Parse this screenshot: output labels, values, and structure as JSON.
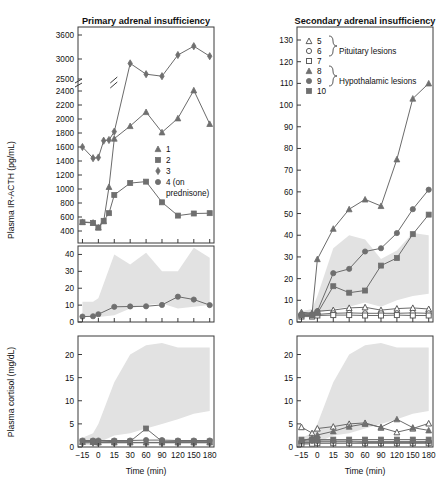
{
  "figure": {
    "panels": [
      {
        "id": "primary",
        "title": "Primary adrenal insufficiency"
      },
      {
        "id": "secondary",
        "title": "Secondary adrenal insufficiency"
      }
    ],
    "axis_labels": {
      "y_acth": "Plasma IR-ACTH (pg/mL)",
      "y_cortisol": "Plasma cortisol (mg/dL)",
      "x_time": "Time (min)"
    }
  },
  "legends": {
    "primary": {
      "items": [
        {
          "marker": "triangle-filled",
          "label": "1"
        },
        {
          "marker": "square-filled",
          "label": "2"
        },
        {
          "marker": "diamond-filled",
          "label": "3"
        },
        {
          "marker": "circle-filled",
          "label": "4 (on"
        },
        {
          "marker": "none",
          "label": "prednisone)"
        }
      ]
    },
    "secondary": {
      "items": [
        {
          "marker": "triangle-open",
          "label": "5"
        },
        {
          "marker": "circle-open",
          "label": "6"
        },
        {
          "marker": "square-open",
          "label": "7"
        },
        {
          "marker": "triangle-filled",
          "label": "8"
        },
        {
          "marker": "circle-filled",
          "label": "9"
        },
        {
          "marker": "square-filled",
          "label": "10"
        }
      ],
      "group_labels": [
        "Pituitary lesions",
        "Hypothalamic lesions"
      ]
    }
  },
  "chart_data": [
    {
      "id": "primary-acth-upper",
      "type": "line",
      "title": "Primary adrenal insufficiency",
      "xlabel": "Time (min)",
      "ylabel": "Plasma IR-ACTH (pg/mL)",
      "x": [
        -15,
        -10,
        -5,
        0,
        5,
        10,
        15,
        30,
        60,
        90,
        120,
        150,
        180
      ],
      "xlim": [
        -20,
        188
      ],
      "ylim": [
        350,
        3750
      ],
      "yticks": [
        400,
        600,
        800,
        1000,
        1200,
        1400,
        1600,
        1800,
        2000,
        2200,
        2400,
        2500,
        3000,
        3600
      ],
      "axis_break_between": [
        2400,
        2500
      ],
      "xticks": [
        -15,
        0,
        15,
        30,
        60,
        90,
        120,
        150,
        180
      ],
      "xticklabels": [
        "-15",
        "0",
        "15",
        "30",
        "60",
        "90",
        "120",
        "150",
        "180"
      ],
      "grid": false,
      "series": [
        {
          "name": "1",
          "marker": "triangle-filled",
          "x": [
            -15,
            -5,
            0,
            5,
            10,
            15,
            30,
            60,
            90,
            120,
            150,
            180
          ],
          "values": [
            530,
            520,
            450,
            540,
            1030,
            1720,
            1900,
            2100,
            1810,
            2010,
            2410,
            1930
          ]
        },
        {
          "name": "2",
          "marker": "square-filled",
          "x": [
            -15,
            -5,
            0,
            5,
            10,
            15,
            30,
            60,
            90,
            120,
            150,
            180
          ],
          "values": [
            525,
            515,
            450,
            545,
            655,
            915,
            1085,
            1105,
            810,
            620,
            650,
            655
          ]
        },
        {
          "name": "3",
          "marker": "diamond-filled",
          "x": [
            -15,
            -5,
            0,
            5,
            10,
            15,
            30,
            60,
            90,
            120,
            150,
            180
          ],
          "values": [
            1600,
            1440,
            1450,
            1690,
            1700,
            1820,
            2890,
            2620,
            2570,
            3100,
            3320,
            3070
          ]
        }
      ]
    },
    {
      "id": "primary-acth-lower",
      "type": "line",
      "ylim": [
        0,
        45
      ],
      "yticks": [
        0,
        10,
        20,
        30,
        40
      ],
      "x": [
        -15,
        -5,
        0,
        15,
        30,
        60,
        90,
        120,
        150,
        180
      ],
      "normal_range_band": {
        "x": [
          -15,
          -5,
          0,
          15,
          30,
          60,
          90,
          120,
          150,
          180
        ],
        "lower": [
          3,
          3,
          3,
          4,
          8,
          10,
          11,
          8,
          9,
          10
        ],
        "upper": [
          12,
          12,
          14,
          40,
          34,
          41,
          30,
          30,
          44,
          38
        ]
      },
      "series": [
        {
          "name": "4 (on prednisone)",
          "marker": "circle-filled",
          "x": [
            -15,
            -5,
            0,
            15,
            30,
            60,
            90,
            120,
            150,
            180
          ],
          "values": [
            3.2,
            3.4,
            4.6,
            9.0,
            9.2,
            9.3,
            10.1,
            15.0,
            13.3,
            10.0
          ]
        }
      ]
    },
    {
      "id": "primary-cortisol",
      "type": "line",
      "ylabel": "Plasma cortisol (mg/dL)",
      "xlabel": "Time (min)",
      "ylim": [
        0,
        24
      ],
      "yticks": [
        0,
        5,
        10,
        15,
        20
      ],
      "xticks": [
        -15,
        0,
        15,
        30,
        60,
        90,
        120,
        150,
        180
      ],
      "normal_range_band": {
        "x": [
          -15,
          -5,
          0,
          15,
          30,
          60,
          90,
          120,
          150,
          180
        ],
        "lower": [
          0.4,
          0.5,
          1.0,
          2.5,
          3.0,
          4.0,
          5.0,
          6.0,
          7.2,
          7.8
        ],
        "upper": [
          2.0,
          3.0,
          5.0,
          14.0,
          20.0,
          22.0,
          22.5,
          21.5,
          21.5,
          21.5
        ]
      },
      "series": [
        {
          "name": "1",
          "marker": "triangle-filled",
          "x": [
            -15,
            -5,
            0,
            15,
            30,
            60,
            90,
            120,
            150,
            180
          ],
          "values": [
            1.1,
            1.1,
            1.0,
            1.0,
            1.0,
            1.0,
            1.0,
            1.0,
            1.0,
            1.0
          ]
        },
        {
          "name": "2",
          "marker": "square-filled",
          "x": [
            -15,
            -5,
            0,
            15,
            30,
            60,
            90,
            120,
            150,
            180
          ],
          "values": [
            1.2,
            1.2,
            1.1,
            1.2,
            1.2,
            4.0,
            1.2,
            1.2,
            1.2,
            1.2
          ]
        },
        {
          "name": "3",
          "marker": "diamond-filled",
          "x": [
            -15,
            -5,
            0,
            15,
            30,
            60,
            90,
            120,
            150,
            180
          ],
          "values": [
            0.9,
            0.9,
            0.9,
            0.9,
            0.9,
            0.9,
            0.9,
            0.9,
            0.9,
            0.9
          ]
        },
        {
          "name": "4 (on prednisone)",
          "marker": "circle-filled",
          "x": [
            -15,
            -5,
            0,
            15,
            30,
            60,
            90,
            120,
            150,
            180
          ],
          "values": [
            1.4,
            1.4,
            1.4,
            1.4,
            1.4,
            1.5,
            1.5,
            1.4,
            1.4,
            1.4
          ]
        }
      ]
    },
    {
      "id": "secondary-acth",
      "type": "line",
      "title": "Secondary adrenal insufficiency",
      "xlabel": "Time (min)",
      "ylabel": "Plasma IR-ACTH (pg/mL)",
      "ylim": [
        0,
        136
      ],
      "yticks": [
        0,
        10,
        20,
        30,
        40,
        50,
        60,
        70,
        80,
        90,
        100,
        110,
        120,
        130
      ],
      "xticks": [
        -15,
        0,
        15,
        30,
        60,
        90,
        120,
        150,
        180
      ],
      "xticklabels": [
        "-15",
        "0",
        "15",
        "30",
        "60",
        "90",
        "120",
        "150",
        "180"
      ],
      "normal_range_band": {
        "x": [
          -15,
          -5,
          0,
          15,
          30,
          60,
          90,
          120,
          150,
          180
        ],
        "lower": [
          3,
          3,
          4,
          6,
          7,
          9,
          7,
          10,
          12,
          13
        ],
        "upper": [
          5,
          6,
          12,
          34,
          40,
          38,
          29,
          33,
          41,
          40
        ]
      },
      "series": [
        {
          "name": "5",
          "marker": "triangle-open",
          "x": [
            -15,
            -5,
            0,
            15,
            30,
            60,
            90,
            120,
            150,
            180
          ],
          "values": [
            4.5,
            4.0,
            5.0,
            5.5,
            6.5,
            6.8,
            5.5,
            6.2,
            6.5,
            6.0
          ]
        },
        {
          "name": "6",
          "marker": "circle-open",
          "x": [
            -15,
            -5,
            0,
            15,
            30,
            60,
            90,
            120,
            150,
            180
          ],
          "values": [
            3.0,
            3.0,
            3.5,
            4.0,
            4.2,
            4.0,
            4.0,
            4.0,
            4.2,
            4.0
          ]
        },
        {
          "name": "7",
          "marker": "square-open",
          "x": [
            -15,
            -5,
            0,
            15,
            30,
            60,
            90,
            120,
            150,
            180
          ],
          "values": [
            2.5,
            2.5,
            3.0,
            3.2,
            3.2,
            3.0,
            3.0,
            3.2,
            3.0,
            3.0
          ]
        },
        {
          "name": "8",
          "marker": "triangle-filled",
          "x": [
            -15,
            -5,
            0,
            15,
            30,
            60,
            90,
            120,
            150,
            180
          ],
          "values": [
            4.0,
            4.0,
            29.0,
            43.0,
            52.0,
            56.5,
            53.5,
            75.0,
            103.0,
            110.0
          ]
        },
        {
          "name": "9",
          "marker": "circle-filled",
          "x": [
            -15,
            -5,
            0,
            15,
            30,
            60,
            90,
            120,
            150,
            180
          ],
          "values": [
            3.5,
            3.5,
            5.0,
            22.5,
            24.5,
            32.5,
            34.0,
            41.0,
            52.0,
            61.0
          ]
        },
        {
          "name": "10",
          "marker": "square-filled",
          "x": [
            -15,
            -5,
            0,
            15,
            30,
            60,
            90,
            120,
            150,
            180
          ],
          "values": [
            3.0,
            3.0,
            4.0,
            16.5,
            13.5,
            14.5,
            26.0,
            29.5,
            40.5,
            49.5
          ]
        }
      ]
    },
    {
      "id": "secondary-cortisol",
      "type": "line",
      "ylabel": "Plasma cortisol (mg/dL)",
      "xlabel": "Time (min)",
      "ylim": [
        0,
        24
      ],
      "yticks": [
        0,
        5,
        10,
        15,
        20
      ],
      "xticks": [
        -15,
        0,
        15,
        30,
        60,
        90,
        120,
        150,
        180
      ],
      "normal_range_band": {
        "x": [
          -15,
          -5,
          0,
          15,
          30,
          60,
          90,
          120,
          150,
          180
        ],
        "lower": [
          0.4,
          0.5,
          1.0,
          2.5,
          3.0,
          4.0,
          5.0,
          6.0,
          7.2,
          7.8
        ],
        "upper": [
          2.0,
          3.0,
          5.0,
          14.0,
          20.0,
          22.0,
          22.5,
          21.5,
          21.5,
          21.5
        ]
      },
      "series": [
        {
          "name": "5",
          "marker": "triangle-open",
          "x": [
            -15,
            -5,
            0,
            15,
            30,
            60,
            90,
            120,
            150,
            180
          ],
          "values": [
            4.3,
            3.0,
            4.0,
            4.4,
            5.0,
            5.2,
            4.2,
            3.2,
            4.0,
            5.1
          ]
        },
        {
          "name": "6",
          "marker": "circle-open",
          "x": [
            -15,
            -5,
            0,
            15,
            30,
            60,
            90,
            120,
            150,
            180
          ],
          "values": [
            1.0,
            1.0,
            1.1,
            1.1,
            1.1,
            1.0,
            1.0,
            1.0,
            1.0,
            1.0
          ]
        },
        {
          "name": "7",
          "marker": "square-open",
          "x": [
            -15,
            -5,
            0,
            15,
            30,
            60,
            90,
            120,
            150,
            180
          ],
          "values": [
            0.7,
            0.7,
            0.8,
            0.8,
            0.8,
            0.8,
            0.8,
            0.8,
            0.8,
            0.8
          ]
        },
        {
          "name": "8",
          "marker": "triangle-filled",
          "x": [
            -15,
            -5,
            0,
            15,
            30,
            60,
            90,
            120,
            150,
            180
          ],
          "values": [
            1.2,
            2.0,
            2.6,
            3.4,
            4.4,
            5.0,
            4.3,
            6.0,
            4.2,
            3.6
          ]
        },
        {
          "name": "9",
          "marker": "circle-filled",
          "x": [
            -15,
            -5,
            0,
            15,
            30,
            60,
            90,
            120,
            150,
            180
          ],
          "values": [
            1.3,
            1.3,
            1.3,
            1.3,
            1.3,
            1.2,
            1.2,
            1.2,
            1.2,
            1.2
          ]
        },
        {
          "name": "10",
          "marker": "square-filled",
          "x": [
            -15,
            -5,
            0,
            15,
            30,
            60,
            90,
            120,
            150,
            180
          ],
          "values": [
            1.6,
            1.6,
            1.6,
            1.6,
            1.6,
            1.6,
            1.6,
            1.6,
            1.6,
            1.6
          ]
        }
      ]
    }
  ],
  "colors": {
    "marker": "#6f6f6f",
    "line": "#6b6b6b",
    "band": "#e2e2e2",
    "axis": "#3b3b3b",
    "text": "#111111"
  }
}
